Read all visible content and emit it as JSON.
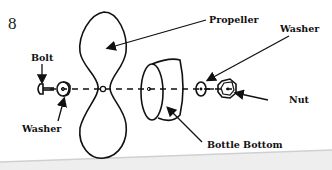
{
  "diagram": {
    "step_number": "8",
    "parts": [
      {
        "id": "bolt",
        "label": "Bolt"
      },
      {
        "id": "washer_left",
        "label": "Washer"
      },
      {
        "id": "propeller",
        "label": "Propeller"
      },
      {
        "id": "bottle_bottom",
        "label": "Bottle Bottom"
      },
      {
        "id": "washer_right",
        "label": "Washer"
      },
      {
        "id": "nut",
        "label": "Nut"
      }
    ],
    "colors": {
      "ink": "#111111",
      "background": "#ffffff",
      "shadow": "#d8d8d8"
    }
  }
}
